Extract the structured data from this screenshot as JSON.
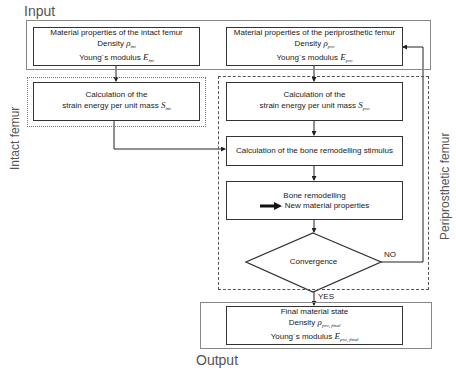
{
  "regions": {
    "input_label": "Input",
    "output_label": "Output",
    "intact_label": "Intact femur",
    "periprosthetic_label": "Periprosthetic femur"
  },
  "boxes": {
    "intact_props": {
      "title": "Material properties of the intact femur",
      "density_label": "Density",
      "density_symbol": "ρ",
      "density_sub": "int",
      "modulus_label": "Young´s modulus",
      "modulus_symbol": "E",
      "modulus_sub": "int"
    },
    "peri_props": {
      "title": "Material properties of the periprosthetic femur",
      "density_label": "Density",
      "density_symbol": "ρ",
      "density_sub": "pro",
      "modulus_label": "Young´s modulus",
      "modulus_symbol": "E",
      "modulus_sub": "pro"
    },
    "intact_strain": {
      "line1": "Calculation of the",
      "line2": "strain energy per unit mass",
      "symbol": "S",
      "sub": "int"
    },
    "peri_strain": {
      "line1": "Calculation of the",
      "line2": "strain energy per unit mass",
      "symbol": "S",
      "sub": "pro"
    },
    "stimulus": {
      "text": "Calculation of the bone remodelling stimulus"
    },
    "remodelling": {
      "line1": "Bone remodelling",
      "line2": "New material properties",
      "arrow_icon": "thick-right-arrow"
    },
    "convergence": {
      "text": "Convergence"
    },
    "final": {
      "title": "Final material state",
      "density_label": "Density",
      "density_symbol": "ρ",
      "density_sub": "pro, final",
      "modulus_label": "Young´s modulus",
      "modulus_symbol": "E",
      "modulus_sub": "pro, final"
    }
  },
  "edges": {
    "yes_label": "YES",
    "no_label": "NO"
  }
}
